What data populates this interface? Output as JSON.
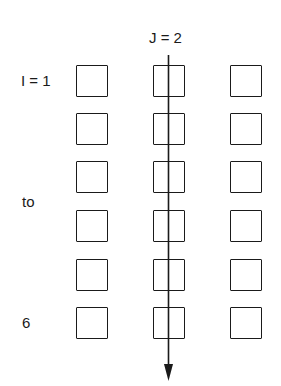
{
  "diagram": {
    "column_label": "J = 2",
    "row_labels": {
      "start": "I = 1",
      "middle": "to",
      "end": "6"
    },
    "grid": {
      "rows": 6,
      "columns": 3,
      "highlighted_column": 2
    },
    "arrow": {
      "direction": "down",
      "through_column": 2
    },
    "colors": {
      "stroke": "#1a1a1a",
      "background": "#ffffff"
    }
  }
}
